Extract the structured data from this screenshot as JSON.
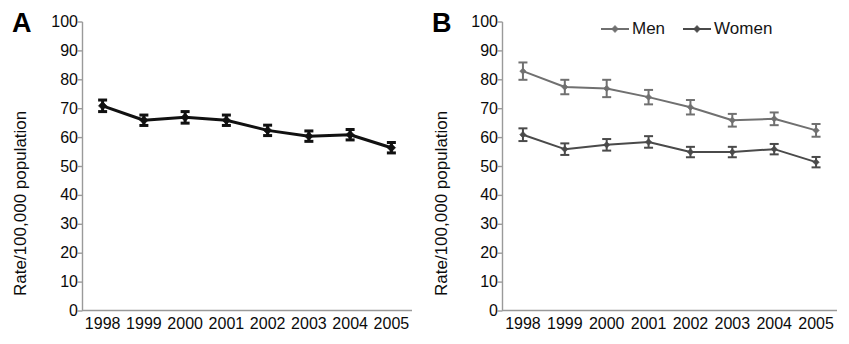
{
  "figure": {
    "panels": [
      {
        "letter": "A",
        "ylabel": "Rate/100,000 population",
        "legend": []
      },
      {
        "letter": "B",
        "ylabel": "Rate/100,000 population",
        "legend": [
          "Men",
          "Women"
        ]
      }
    ]
  },
  "colors": {
    "panel_a_series": "#111111",
    "men_series": "#707070",
    "women_series": "#4a4a4a",
    "axis": "#9a9a9a",
    "text": "#0b0b0b"
  },
  "chart_data": [
    {
      "type": "line",
      "panel": "A",
      "title": "",
      "xlabel": "",
      "ylabel": "Rate/100,000 population",
      "categories": [
        "1998",
        "1999",
        "2000",
        "2001",
        "2002",
        "2003",
        "2004",
        "2005"
      ],
      "x": [
        1998,
        1999,
        2000,
        2001,
        2002,
        2003,
        2004,
        2005
      ],
      "ylim": [
        0,
        100
      ],
      "ytick_labels": [
        "0",
        "10",
        "20",
        "30",
        "40",
        "50",
        "60",
        "70",
        "80",
        "90",
        "100"
      ],
      "yticks": [
        0,
        10,
        20,
        30,
        40,
        50,
        60,
        70,
        80,
        90,
        100
      ],
      "grid": false,
      "legend_position": "none",
      "series": [
        {
          "name": "Overall",
          "color": "#111111",
          "marker": "diamond",
          "values": [
            71.0,
            66.0,
            67.0,
            66.0,
            62.5,
            60.5,
            61.0,
            56.5
          ],
          "errors": [
            2.0,
            1.8,
            2.0,
            1.8,
            1.8,
            1.8,
            1.8,
            1.8
          ]
        }
      ]
    },
    {
      "type": "line",
      "panel": "B",
      "title": "",
      "xlabel": "",
      "ylabel": "Rate/100,000 population",
      "categories": [
        "1998",
        "1999",
        "2000",
        "2001",
        "2002",
        "2003",
        "2004",
        "2005"
      ],
      "x": [
        1998,
        1999,
        2000,
        2001,
        2002,
        2003,
        2004,
        2005
      ],
      "ylim": [
        0,
        100
      ],
      "ytick_labels": [
        "0",
        "10",
        "20",
        "30",
        "40",
        "50",
        "60",
        "70",
        "80",
        "90",
        "100"
      ],
      "yticks": [
        0,
        10,
        20,
        30,
        40,
        50,
        60,
        70,
        80,
        90,
        100
      ],
      "grid": false,
      "legend_position": "top-right",
      "series": [
        {
          "name": "Men",
          "color": "#707070",
          "marker": "diamond",
          "values": [
            83.0,
            77.5,
            77.0,
            74.0,
            70.5,
            66.0,
            66.5,
            62.5
          ],
          "errors": [
            3.0,
            2.5,
            3.0,
            2.5,
            2.5,
            2.2,
            2.2,
            2.2
          ]
        },
        {
          "name": "Women",
          "color": "#4a4a4a",
          "marker": "diamond",
          "values": [
            61.0,
            56.0,
            57.5,
            58.5,
            55.0,
            55.0,
            56.0,
            51.5
          ],
          "errors": [
            2.2,
            2.0,
            2.0,
            2.0,
            1.8,
            1.8,
            1.8,
            1.8
          ]
        }
      ]
    }
  ]
}
